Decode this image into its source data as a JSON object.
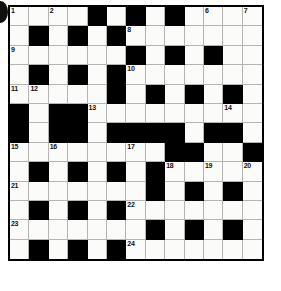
{
  "puzzle": {
    "title": "Crossword Grid",
    "rows": 13,
    "cols": 13,
    "cell_size": 19.4,
    "colors": {
      "block": "#000000",
      "open": "#fbfbfa",
      "grid_line": "#b4b4b4",
      "frame": "#000000",
      "number_text": "#111111",
      "page_background": "#ffffff",
      "edge_mark": "#101010"
    },
    "edge_mark": {
      "name": "binding-hole-mark",
      "shape": "circle",
      "clipped": true
    },
    "legend": {
      "block_char": "#",
      "open_char": "."
    },
    "grid": [
      "....#.#.#....",
      "......#######",
      ".............",
      "#.#.#.#.#.#.#",
      ".......#.#.#.",
      "#.##.........",
      "#.##.####.##.",
      ".............",
      ".#.#.#.#.....",
      ".......#.#.#.",
      "...##........",
      ".......#.#.#.",
      ".#.#.#......."
    ],
    "grid_rows": [
      [
        "white",
        "white",
        "white",
        "white",
        "black",
        "white",
        "black",
        "white",
        "black",
        "white",
        "white",
        "white",
        "white"
      ],
      [
        "white",
        "black",
        "white",
        "black",
        "white",
        "black",
        "white",
        "white",
        "white",
        "white",
        "white",
        "white",
        "white"
      ],
      [
        "white",
        "white",
        "white",
        "white",
        "white",
        "white",
        "black",
        "white",
        "black",
        "white",
        "black",
        "white",
        "white"
      ],
      [
        "white",
        "black",
        "white",
        "black",
        "white",
        "black",
        "white",
        "white",
        "white",
        "white",
        "white",
        "white",
        "white"
      ],
      [
        "white",
        "white",
        "white",
        "white",
        "white",
        "black",
        "white",
        "black",
        "white",
        "black",
        "white",
        "black",
        "white"
      ],
      [
        "black",
        "white",
        "black",
        "black",
        "white",
        "white",
        "white",
        "white",
        "white",
        "white",
        "white",
        "white",
        "white"
      ],
      [
        "black",
        "white",
        "black",
        "black",
        "white",
        "black",
        "black",
        "black",
        "black",
        "white",
        "black",
        "black",
        "white"
      ],
      [
        "white",
        "white",
        "white",
        "white",
        "white",
        "white",
        "white",
        "white",
        "black",
        "black",
        "white",
        "white",
        "black"
      ],
      [
        "white",
        "black",
        "white",
        "black",
        "white",
        "black",
        "white",
        "black",
        "white",
        "white",
        "white",
        "white",
        "white"
      ],
      [
        "white",
        "white",
        "white",
        "white",
        "white",
        "white",
        "white",
        "black",
        "white",
        "black",
        "white",
        "black",
        "white"
      ],
      [
        "white",
        "black",
        "white",
        "black",
        "white",
        "black",
        "white",
        "white",
        "white",
        "white",
        "white",
        "white",
        "white"
      ],
      [
        "white",
        "white",
        "white",
        "white",
        "white",
        "white",
        "white",
        "black",
        "white",
        "black",
        "white",
        "black",
        "white"
      ],
      [
        "white",
        "black",
        "white",
        "black",
        "white",
        "black",
        "white",
        "white",
        "white",
        "white",
        "white",
        "white",
        "white"
      ]
    ],
    "numbers": [
      {
        "label": "1",
        "row": 1,
        "col": 1
      },
      {
        "label": "2",
        "row": 1,
        "col": 3
      },
      {
        "label": "3",
        "row": 1,
        "col": 5
      },
      {
        "label": "4",
        "row": 1,
        "col": 7
      },
      {
        "label": "5",
        "row": 1,
        "col": 9
      },
      {
        "label": "6",
        "row": 1,
        "col": 11
      },
      {
        "label": "7",
        "row": 1,
        "col": 13
      },
      {
        "label": "8",
        "row": 2,
        "col": 7
      },
      {
        "label": "9",
        "row": 3,
        "col": 1
      },
      {
        "label": "10",
        "row": 4,
        "col": 7
      },
      {
        "label": "11",
        "row": 5,
        "col": 1
      },
      {
        "label": "12",
        "row": 5,
        "col": 2
      },
      {
        "label": "13",
        "row": 6,
        "col": 5
      },
      {
        "label": "14",
        "row": 6,
        "col": 12
      },
      {
        "label": "15",
        "row": 8,
        "col": 1
      },
      {
        "label": "16",
        "row": 8,
        "col": 3
      },
      {
        "label": "17",
        "row": 8,
        "col": 7
      },
      {
        "label": "18",
        "row": 9,
        "col": 9
      },
      {
        "label": "19",
        "row": 9,
        "col": 11
      },
      {
        "label": "20",
        "row": 9,
        "col": 13
      },
      {
        "label": "21",
        "row": 10,
        "col": 1
      },
      {
        "label": "22",
        "row": 11,
        "col": 7
      },
      {
        "label": "23",
        "row": 12,
        "col": 1
      },
      {
        "label": "24",
        "row": 13,
        "col": 7
      }
    ]
  }
}
